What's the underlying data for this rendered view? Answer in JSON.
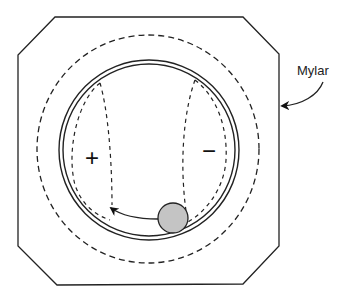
{
  "diagram": {
    "type": "schematic",
    "labels": {
      "mylar": "Mylar",
      "positive": "+",
      "negative": "−"
    },
    "colors": {
      "stroke": "#222222",
      "ball_fill": "#c4c4c4",
      "background": "#ffffff"
    },
    "elements": [
      {
        "name": "octagon-frame",
        "kind": "solid outline"
      },
      {
        "name": "outer-dashed-circle",
        "kind": "dashed circle"
      },
      {
        "name": "double-solid-ring",
        "kind": "two concentric solid circles"
      },
      {
        "name": "positive-region",
        "kind": "dashed lens, left",
        "label": "+"
      },
      {
        "name": "negative-region",
        "kind": "dashed lens, right",
        "label": "−"
      },
      {
        "name": "ball",
        "kind": "gray filled circle at bottom of ring"
      },
      {
        "name": "motion-arrow",
        "kind": "curved arrow from ball toward left region"
      },
      {
        "name": "mylar-callout",
        "kind": "curved arrow pointing to frame",
        "label": "Mylar"
      }
    ]
  }
}
